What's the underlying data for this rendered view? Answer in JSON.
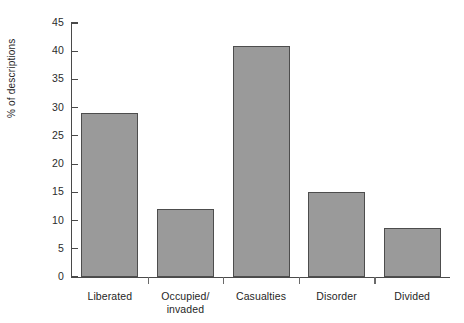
{
  "chart_data": {
    "type": "bar",
    "title": "",
    "xlabel": "",
    "ylabel": "% of descriptions",
    "categories": [
      "Liberated",
      "Occupied/\ninvaded",
      "Casualties",
      "Disorder",
      "Divided"
    ],
    "values": [
      29,
      12,
      41,
      15,
      8.7
    ],
    "ylim": [
      0,
      45
    ],
    "ytick_values": [
      0,
      5,
      10,
      15,
      20,
      25,
      30,
      35,
      40,
      45
    ],
    "ytick_labels": [
      "0",
      "5",
      "10",
      "15",
      "20",
      "25",
      "30",
      "35",
      "40",
      "45"
    ],
    "grid": false,
    "legend": null,
    "bar_color": "#9d9d9d",
    "bar_edge_color": "#4d4d4d",
    "axis_color": "#4a4a4a",
    "background": "#ffffff",
    "annotations": []
  },
  "axis": {
    "y_title": "% of descriptions"
  }
}
